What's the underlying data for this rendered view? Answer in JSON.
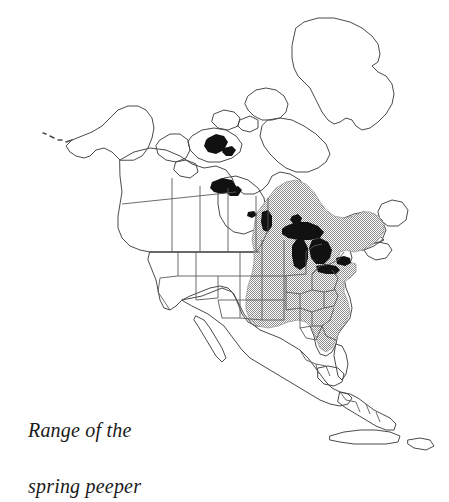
{
  "figure": {
    "kind": "range-map",
    "subject": "spring peeper",
    "region": "North America",
    "background_color": "#ffffff"
  },
  "caption": {
    "line1": "Range of the",
    "line2": "spring peeper",
    "full_text": "Range of the spring peeper"
  },
  "legend": {
    "range_fill_label": "shaded range area",
    "range_fill_color": "#a8a8a8",
    "water_fill_label": "lakes",
    "water_fill_color": "#111111",
    "coastline_color": "#444444",
    "border_color": "#555555"
  },
  "map": {
    "title": "Range of the spring peeper",
    "landmasses": [
      "Alaska",
      "Aleutian Islands",
      "Canada",
      "Greenland",
      "Arctic Archipelago",
      "United States",
      "Mexico",
      "Baja California",
      "Central America",
      "Cuba",
      "Hispaniola",
      "Newfoundland",
      "Nova Scotia",
      "Florida"
    ],
    "black_water_bodies": [
      "Great Bear Lake",
      "Great Slave Lake",
      "Lake Winnipeg",
      "Lake Superior",
      "Lake Michigan",
      "Lake Huron",
      "Lake Erie",
      "Lake Ontario"
    ],
    "range_description": "Eastern North America from southeastern Canada and the Maritimes west to the eastern Great Plains and south to the Gulf Coast, excluding southern Florida.",
    "range_shading": "stipple"
  }
}
